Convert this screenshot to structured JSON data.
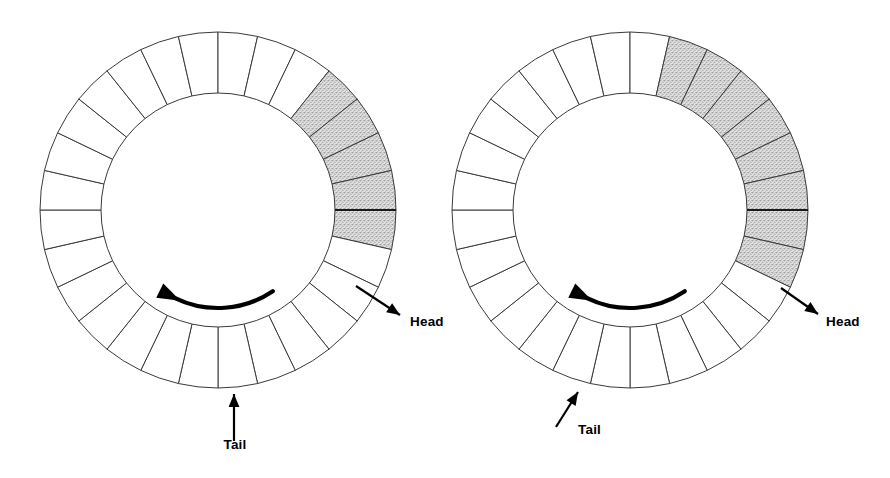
{
  "figure": {
    "type": "two-panel-annular-ring-diagram",
    "background_color": "#ffffff",
    "stroke_color": "#3a3a3a",
    "shade_color": "#c9c9c9",
    "label_color": "#000000",
    "canvas": {
      "width": 890,
      "height": 478
    }
  },
  "chart_data": {
    "type": "diagram",
    "title": "",
    "panels": [
      {
        "name": "left-ring",
        "center_x": 218,
        "center_y": 210,
        "outer_radius": 178,
        "inner_radius": 117,
        "segment_count": 28,
        "origin_angle_deg": 0,
        "shaded_segment_indices": [
          24,
          25,
          26,
          27,
          0
        ],
        "shaded_count": 5,
        "rotation_direction": "counterclockwise",
        "head_label": "Head",
        "tail_label": "Tail",
        "head_anchor_angle_deg": -22,
        "tail_anchor_angle_deg": -95,
        "head_label_x": 410,
        "head_label_y": 326,
        "tail_label_x": 235,
        "tail_label_y": 449,
        "head_line": {
          "x1": 356,
          "y1": 286,
          "x2": 400,
          "y2": 315
        },
        "tail_line": {
          "x1": 234,
          "y1": 441,
          "x2": 234,
          "y2": 394
        }
      },
      {
        "name": "right-ring",
        "center_x": 630,
        "center_y": 210,
        "outer_radius": 178,
        "inner_radius": 117,
        "segment_count": 28,
        "origin_angle_deg": 0,
        "shaded_segment_indices": [
          22,
          23,
          24,
          25,
          26,
          27,
          0,
          1
        ],
        "shaded_count": 8,
        "rotation_direction": "counterclockwise",
        "head_label": "Head",
        "tail_label": "Tail",
        "head_anchor_angle_deg": -13,
        "tail_anchor_angle_deg": -116,
        "head_label_x": 826,
        "head_label_y": 326,
        "tail_label_x": 578,
        "tail_label_y": 434,
        "head_line": {
          "x1": 781,
          "y1": 288,
          "x2": 818,
          "y2": 314
        },
        "tail_line": {
          "x1": 556,
          "y1": 427,
          "x2": 578,
          "y2": 392
        }
      }
    ],
    "legend": [],
    "annotations": [
      {
        "text": "Head",
        "panel": "left-ring",
        "role": "leading-end-marker"
      },
      {
        "text": "Tail",
        "panel": "left-ring",
        "role": "trailing-end-marker"
      },
      {
        "text": "Head",
        "panel": "right-ring",
        "role": "leading-end-marker"
      },
      {
        "text": "Tail",
        "panel": "right-ring",
        "role": "trailing-end-marker"
      }
    ]
  },
  "labels": {
    "left_head": "Head",
    "left_tail": "Tail",
    "right_head": "Head",
    "right_tail": "Tail"
  },
  "icons": {
    "rotation_arrow": "curved-arrow-counterclockwise",
    "head_pointer": "arrow-pointer-icon",
    "tail_pointer": "arrow-pointer-icon"
  }
}
